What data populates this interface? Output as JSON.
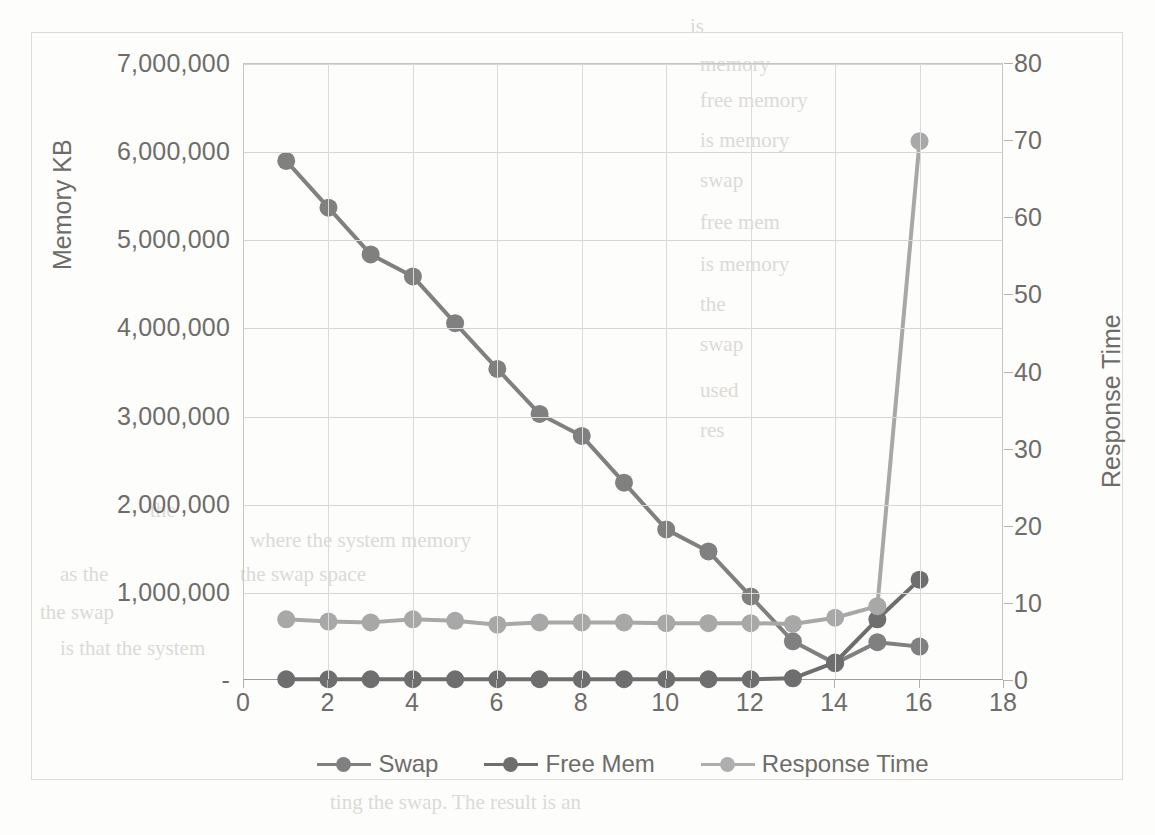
{
  "chart_data": {
    "type": "line",
    "title": "",
    "xlabel": "",
    "ylabel": "Memory KB",
    "y2label": "Response Time",
    "grid": true,
    "legend_position": "bottom",
    "x": [
      1,
      2,
      3,
      4,
      5,
      6,
      7,
      8,
      9,
      10,
      11,
      12,
      13,
      14,
      15,
      16
    ],
    "xlim": [
      0,
      18
    ],
    "xticks": [
      "0",
      "2",
      "4",
      "6",
      "8",
      "10",
      "12",
      "14",
      "16",
      "18"
    ],
    "xtick_values": [
      0,
      2,
      4,
      6,
      8,
      10,
      12,
      14,
      16,
      18
    ],
    "ylim": [
      0,
      7000000
    ],
    "yticks": [
      "-",
      "1,000,000",
      "2,000,000",
      "3,000,000",
      "4,000,000",
      "5,000,000",
      "6,000,000",
      "7,000,000"
    ],
    "ytick_values": [
      0,
      1000000,
      2000000,
      3000000,
      4000000,
      5000000,
      6000000,
      7000000
    ],
    "y2lim": [
      0,
      80
    ],
    "y2ticks": [
      "0",
      "10",
      "20",
      "30",
      "40",
      "50",
      "60",
      "70",
      "80"
    ],
    "y2tick_values": [
      0,
      10,
      20,
      30,
      40,
      50,
      60,
      70,
      80
    ],
    "series": [
      {
        "name": "Swap",
        "axis": "left",
        "color": "#808080",
        "values": [
          5900000,
          5370000,
          4840000,
          4590000,
          4060000,
          3540000,
          3030000,
          2780000,
          2250000,
          1720000,
          1470000,
          960000,
          450000,
          200000,
          440000,
          390000
        ]
      },
      {
        "name": "Free Mem",
        "axis": "left",
        "color": "#6e6e6e",
        "values": [
          20000,
          20000,
          20000,
          20000,
          20000,
          20000,
          20000,
          20000,
          20000,
          20000,
          20000,
          20000,
          30000,
          210000,
          700000,
          1150000
        ]
      },
      {
        "name": "Response Time",
        "axis": "right",
        "color": "#a8a8a8",
        "values": [
          8,
          7.7,
          7.6,
          8,
          7.8,
          7.3,
          7.6,
          7.6,
          7.6,
          7.5,
          7.5,
          7.5,
          7.4,
          8.2,
          9.7,
          70
        ]
      }
    ]
  },
  "legend": {
    "items": [
      {
        "label": "Swap",
        "color": "#808080"
      },
      {
        "label": "Free Mem",
        "color": "#6e6e6e"
      },
      {
        "label": "Response Time",
        "color": "#aeaeae"
      }
    ]
  },
  "axis_titles": {
    "left": "Memory KB",
    "right": "Response Time"
  }
}
